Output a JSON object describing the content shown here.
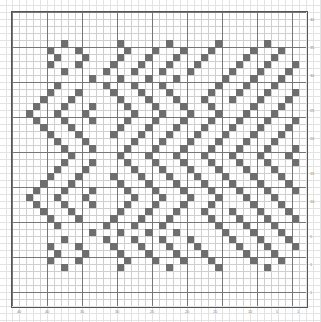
{
  "chart_data": {
    "type": "heatmap",
    "title": "",
    "subtitle": "",
    "xlabel": "",
    "ylabel": "",
    "grid": true,
    "legend": "none",
    "grid_cols": 42,
    "grid_rows": 42,
    "cell_px": 7,
    "filled_color": "#6e6e6e",
    "empty_color": "#ffffff",
    "minor_gridline_color": "#cfcfcf",
    "major_gridline_color": "#777777",
    "frame_color": "#555555",
    "major_every": 5,
    "xlim": [
      0,
      42
    ],
    "ylim": [
      0,
      42
    ],
    "rows": [
      "000000000000000000000000000000000000000000",
      "000000000000000000000000000000000000000000",
      "000000000000000000000000000000000000000000",
      "000000000000000000000000000000000000000000",
      "000000010000000100000010000001000000100000",
      "000001000100000010001000100010000010001000",
      "000000100010000100010001000100000100010000",
      "000001000100001000100010001000001000100010",
      "000000010000010001000100010000010001000100",
      "000000000001000100010001000000100010001000",
      "000000100000010001000100000001000100010000",
      "000001000100001000100010000010001000100010",
      "000010001000000100010001000100010001000100",
      "000100010001000010001000100010000010001000",
      "001000100010000001000100010001000100010000",
      "000100010001000010001000100010001000100010",
      "000010001000000100010001000100010001000100",
      "000001000100001000100010001000100010001000",
      "000000100010000001000100010001000100010000",
      "000000010001000010001000100010001000100010",
      "000000001000000100010001000100010001000100",
      "000000010001000010001000100010001000100010",
      "000000100010000001000100010001000100010000",
      "000001000100001000100010001000100010001000",
      "000010001000000100010001000100010001000100",
      "000100010001000010001000100010001000100010",
      "001000100010000001000100010001000100010000",
      "000100010001000010001000100010000010001000",
      "000010001000000100010001000100010001000100",
      "000001000100001000100010000010001000100010",
      "000000100000010001000100000001000100010000",
      "000000000001000100010001000000100010001000",
      "000000010000010001000100010000010001000100",
      "000001000100001000100010001000001000100010",
      "000000100010000100010001000100000100010000",
      "000001000100000010001000100010000010001000",
      "000000010000000100000010000001000000100000",
      "000000000000000000000000000000000000000000",
      "000000000000000000000000000000000000000000",
      "000000000000000000000000000000000000000000",
      "000000000000000000000000000000000000000000",
      "000000000000000000000000000000000000000000"
    ]
  },
  "axes": {
    "bottom_ticks": [
      {
        "label": "40",
        "cell": 1
      },
      {
        "label": "40",
        "cell": 5
      },
      {
        "label": "35",
        "cell": 10
      },
      {
        "label": "30",
        "cell": 15
      },
      {
        "label": "25",
        "cell": 20
      },
      {
        "label": "20",
        "cell": 25
      },
      {
        "label": "15",
        "cell": 29
      },
      {
        "label": "10",
        "cell": 34
      },
      {
        "label": "5",
        "cell": 38
      },
      {
        "label": "1",
        "cell": 41
      }
    ],
    "right_ticks": [
      {
        "label": "40",
        "cell": 1
      },
      {
        "label": "35",
        "cell": 5
      },
      {
        "label": "30",
        "cell": 9
      },
      {
        "label": "25",
        "cell": 14
      },
      {
        "label": "20",
        "cell": 18
      },
      {
        "label": "15",
        "cell": 23
      },
      {
        "label": "10",
        "cell": 27
      },
      {
        "label": "5",
        "cell": 32
      },
      {
        "label": "1",
        "cell": 36
      },
      {
        "label": "1",
        "cell": 40
      }
    ]
  }
}
